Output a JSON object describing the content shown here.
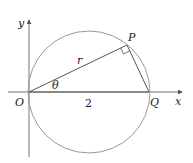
{
  "diagram": {
    "type": "polar-circle-geometry",
    "labels": {
      "y_axis": "y",
      "x_axis": "x",
      "origin": "O",
      "point_p": "P",
      "point_q": "Q",
      "radius": "r",
      "angle": "θ",
      "diameter_length": "2"
    },
    "colors": {
      "axis": "#777777",
      "circle": "#999999",
      "lines": "#555555",
      "text": "#222222"
    }
  }
}
